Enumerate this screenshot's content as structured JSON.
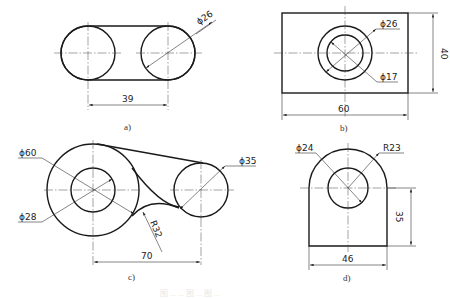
{
  "figures": [
    {
      "id": "a",
      "caption": "a)",
      "dimensions": {
        "diameter": "ϕ26",
        "center_distance": "39"
      }
    },
    {
      "id": "b",
      "caption": "b)",
      "dimensions": {
        "outer_diameter": "ϕ26",
        "inner_diameter": "ϕ17",
        "width": "60",
        "height": "40"
      }
    },
    {
      "id": "c",
      "caption": "c)",
      "dimensions": {
        "large_diameter": "ϕ60",
        "hole_diameter": "ϕ28",
        "small_diameter": "ϕ35",
        "fillet_radius": "R32",
        "center_distance": "70"
      }
    },
    {
      "id": "d",
      "caption": "d)",
      "dimensions": {
        "hole_diameter": "ϕ24",
        "arc_radius": "R23",
        "height": "35",
        "width": "46"
      }
    }
  ],
  "footer_caption": "图 ... ... 图 ... 图 ..."
}
